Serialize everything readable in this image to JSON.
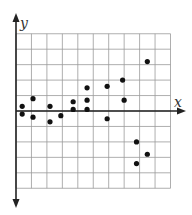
{
  "chart_data": {
    "type": "scatter",
    "title": "",
    "xlabel": "x",
    "ylabel": "y",
    "grid": true,
    "xlim": [
      0,
      10
    ],
    "ylim": [
      -5,
      5
    ],
    "legend": null,
    "points": [
      {
        "x": 0.4,
        "y": 0.3
      },
      {
        "x": 0.4,
        "y": -0.2
      },
      {
        "x": 1.1,
        "y": 0.8
      },
      {
        "x": 1.1,
        "y": -0.4
      },
      {
        "x": 2.2,
        "y": 0.3
      },
      {
        "x": 2.2,
        "y": -0.7
      },
      {
        "x": 2.9,
        "y": -0.3
      },
      {
        "x": 3.7,
        "y": 0.6
      },
      {
        "x": 3.7,
        "y": 0.1
      },
      {
        "x": 4.6,
        "y": 1.5
      },
      {
        "x": 4.6,
        "y": 0.7
      },
      {
        "x": 4.6,
        "y": 0.1
      },
      {
        "x": 5.9,
        "y": 1.6
      },
      {
        "x": 5.9,
        "y": -0.5
      },
      {
        "x": 6.9,
        "y": 2.0
      },
      {
        "x": 7.0,
        "y": 0.7
      },
      {
        "x": 8.5,
        "y": 3.2
      },
      {
        "x": 7.8,
        "y": -2.0
      },
      {
        "x": 8.5,
        "y": -2.8
      },
      {
        "x": 7.8,
        "y": -3.4
      }
    ]
  },
  "colors": {
    "grid": "#9a9a9a",
    "axis": "#222222",
    "point": "#111111"
  }
}
